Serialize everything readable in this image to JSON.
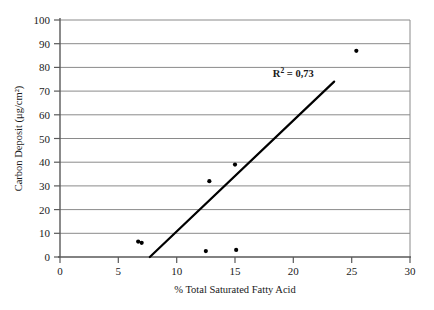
{
  "chart_data": {
    "type": "scatter",
    "title": "",
    "xlabel": "% Total Saturated Fatty Acid",
    "ylabel": "Carbon Deposit (μg/cm²)",
    "xlim": [
      0,
      30
    ],
    "ylim": [
      0,
      100
    ],
    "xticks": [
      "0",
      "5",
      "10",
      "15",
      "20",
      "25",
      "30"
    ],
    "yticks": [
      "0",
      "10",
      "20",
      "30",
      "40",
      "50",
      "60",
      "70",
      "80",
      "90",
      "100"
    ],
    "xtick_values": [
      0,
      5,
      10,
      15,
      20,
      25,
      30
    ],
    "ytick_values": [
      0,
      10,
      20,
      30,
      40,
      50,
      60,
      70,
      80,
      90,
      100
    ],
    "grid": "horizontal",
    "legend": "none",
    "points": [
      {
        "x": 6.7,
        "y": 6.5
      },
      {
        "x": 7.0,
        "y": 6.0
      },
      {
        "x": 12.5,
        "y": 2.5
      },
      {
        "x": 12.8,
        "y": 32.0
      },
      {
        "x": 15.1,
        "y": 3.0
      },
      {
        "x": 15.0,
        "y": 39.0
      },
      {
        "x": 25.4,
        "y": 87.0
      }
    ],
    "trendline": {
      "x0": 7.7,
      "y0": 0,
      "x1": 23.5,
      "y1": 74.0
    },
    "annotations": [
      {
        "text": "R",
        "sup": "2",
        "rest": " = 0,73",
        "x": 20.0,
        "y": 76.0
      }
    ],
    "marker_color": "#000000",
    "trendline_color": "#000000",
    "grid_color": "#808080",
    "axis_color": "#595959",
    "background_color": "#ffffff"
  }
}
